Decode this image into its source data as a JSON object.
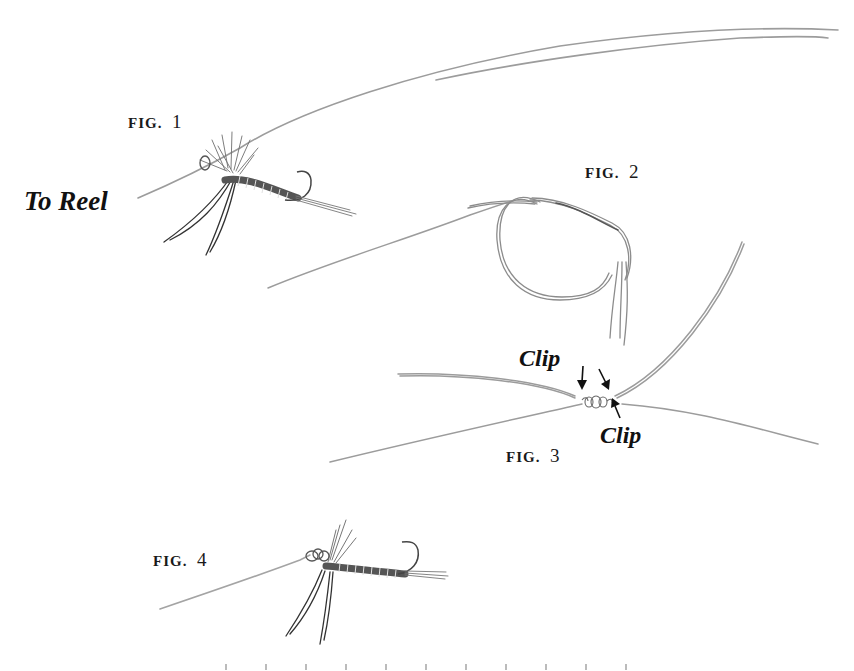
{
  "illustration": {
    "subject": "Fly-fishing knot: tying a dry fly to the tippet",
    "colors": {
      "line": "#9a9a9a",
      "line_dark": "#555555",
      "ink": "#1a1a1a",
      "background": "#ffffff"
    },
    "figures": [
      {
        "id": "fig1",
        "label": "FIG.",
        "number": "1",
        "depicts": "dry fly threaded on leader, line running to reel"
      },
      {
        "id": "fig2",
        "label": "FIG.",
        "number": "2",
        "depicts": "loop knot formed in tippet"
      },
      {
        "id": "fig3",
        "label": "FIG.",
        "number": "3",
        "depicts": "tightened knot with tag ends to clip"
      },
      {
        "id": "fig4",
        "label": "FIG.",
        "number": "4",
        "depicts": "finished knot at hook eye of dry fly"
      }
    ],
    "annotations": {
      "to_reel": "To Reel",
      "clip_upper": "Clip",
      "clip_lower": "Clip"
    },
    "icons": {
      "arrow_1": "arrow-down-icon",
      "arrow_2": "arrow-down-right-icon",
      "arrow_3": "arrow-up-left-icon"
    }
  }
}
